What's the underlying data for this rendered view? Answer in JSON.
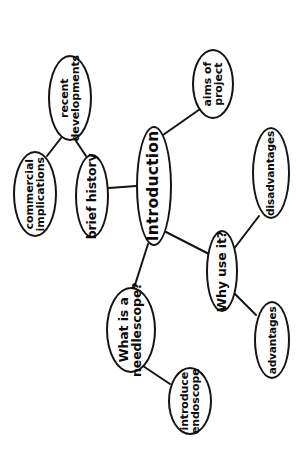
{
  "diagram": {
    "type": "mind-map",
    "title": "Introduction",
    "orientation": "rotated-90-landscape",
    "background_color": "#ffffff",
    "stroke_color": "#141414",
    "text_color": "#0a0a0a",
    "nodes": [
      {
        "id": "introduction",
        "label": "Introduction",
        "style": "central",
        "cx": 154,
        "cy": 186,
        "rx": 18,
        "ry": 60
      },
      {
        "id": "aims-of-project",
        "label": "aims of\nproject",
        "style": "plain",
        "cx": 213,
        "cy": 84,
        "rx": 21,
        "ry": 35
      },
      {
        "id": "why-use-it",
        "label": "Why use it?",
        "style": "bold",
        "cx": 222,
        "cy": 271,
        "rx": 16,
        "ry": 41
      },
      {
        "id": "disadvantages",
        "label": "disadvantages",
        "style": "plain thin",
        "cx": 271,
        "cy": 173,
        "rx": 19,
        "ry": 46
      },
      {
        "id": "advantages",
        "label": "advantages",
        "style": "plain thin",
        "cx": 272,
        "cy": 340,
        "rx": 18,
        "ry": 39
      },
      {
        "id": "what-is-a-needlescope",
        "label": "What is a\nneedlescope?",
        "style": "bold",
        "cx": 131,
        "cy": 330,
        "rx": 25,
        "ry": 43
      },
      {
        "id": "introduce-endoscope",
        "label": "introduce\nendoscope",
        "style": "plain",
        "cx": 190,
        "cy": 401,
        "rx": 22,
        "ry": 34
      },
      {
        "id": "brief-history",
        "label": "brief history",
        "style": "bold",
        "cx": 92,
        "cy": 196,
        "rx": 17,
        "ry": 42
      },
      {
        "id": "recent-developments",
        "label": "recent\ndevelopments",
        "style": "plain",
        "cx": 70,
        "cy": 98,
        "rx": 22,
        "ry": 43
      },
      {
        "id": "commercial-implications",
        "label": "commercial\nimplications",
        "style": "plain",
        "cx": 35,
        "cy": 194,
        "rx": 22,
        "ry": 43
      }
    ],
    "edges": [
      {
        "from": "introduction",
        "to": "aims-of-project",
        "x1": 163,
        "y1": 135,
        "x2": 203,
        "y2": 107
      },
      {
        "from": "introduction",
        "to": "why-use-it",
        "x1": 166,
        "y1": 232,
        "x2": 209,
        "y2": 254
      },
      {
        "from": "introduction",
        "to": "what-is-a-needlescope",
        "x1": 148,
        "y1": 244,
        "x2": 134,
        "y2": 288
      },
      {
        "from": "introduction",
        "to": "brief-history",
        "x1": 136,
        "y1": 186,
        "x2": 109,
        "y2": 188
      },
      {
        "from": "why-use-it",
        "to": "disadvantages",
        "x1": 233,
        "y1": 250,
        "x2": 259,
        "y2": 216
      },
      {
        "from": "why-use-it",
        "to": "advantages",
        "x1": 233,
        "y1": 292,
        "x2": 256,
        "y2": 315
      },
      {
        "from": "what-is-a-needlescope",
        "to": "introduce-endoscope",
        "x1": 143,
        "y1": 366,
        "x2": 170,
        "y2": 384
      },
      {
        "from": "brief-history",
        "to": "recent-developments",
        "x1": 86,
        "y1": 156,
        "x2": 76,
        "y2": 141
      },
      {
        "from": "recent-developments",
        "to": "commercial-implications",
        "x1": 61,
        "y1": 138,
        "x2": 47,
        "y2": 156
      }
    ]
  }
}
